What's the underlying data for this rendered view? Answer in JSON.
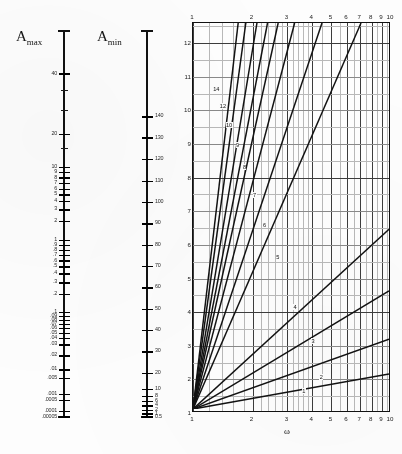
{
  "figure": {
    "type": "nomogram"
  },
  "amax_scale": {
    "title": "A",
    "title_sub": "max",
    "unit": "dB",
    "orientation": "logarithmic-descending",
    "ticks": [
      {
        "label": "40",
        "pos": 0.112
      },
      {
        "label": "",
        "pos": 0.155
      },
      {
        "label": "",
        "pos": 0.205
      },
      {
        "label": "20",
        "pos": 0.268
      },
      {
        "label": "",
        "pos": 0.305
      },
      {
        "label": "10",
        "pos": 0.352
      },
      {
        "label": "9",
        "pos": 0.366
      },
      {
        "label": "8",
        "pos": 0.38
      },
      {
        "label": "7",
        "pos": 0.394
      },
      {
        "label": "6",
        "pos": 0.409
      },
      {
        "label": "5",
        "pos": 0.423
      },
      {
        "label": "4",
        "pos": 0.44
      },
      {
        "label": "3",
        "pos": 0.462
      },
      {
        "label": "2",
        "pos": 0.492
      },
      {
        "label": "1",
        "pos": 0.54
      },
      {
        "label": ".9",
        "pos": 0.553
      },
      {
        "label": ".8",
        "pos": 0.566
      },
      {
        "label": ".7",
        "pos": 0.58
      },
      {
        "label": ".6",
        "pos": 0.594
      },
      {
        "label": ".5",
        "pos": 0.609
      },
      {
        "label": ".4",
        "pos": 0.627
      },
      {
        "label": ".3",
        "pos": 0.65
      },
      {
        "label": ".2",
        "pos": 0.68
      },
      {
        "label": ".1",
        "pos": 0.727
      },
      {
        "label": ".09",
        "pos": 0.737
      },
      {
        "label": ".08",
        "pos": 0.747
      },
      {
        "label": ".07",
        "pos": 0.757
      },
      {
        "label": ".06",
        "pos": 0.768
      },
      {
        "label": ".05",
        "pos": 0.78
      },
      {
        "label": ".04",
        "pos": 0.793
      },
      {
        "label": ".03",
        "pos": 0.81
      },
      {
        "label": ".02",
        "pos": 0.838
      },
      {
        "label": ".01",
        "pos": 0.874
      },
      {
        "label": ".005",
        "pos": 0.896
      },
      {
        "label": ".001",
        "pos": 0.938
      },
      {
        "label": ".0005",
        "pos": 0.953
      },
      {
        "label": ".0001",
        "pos": 0.982
      },
      {
        "label": ".00005",
        "pos": 0.996
      }
    ]
  },
  "amin_scale": {
    "title": "A",
    "title_sub": "min",
    "unit": "dB",
    "orientation": "logarithmic-descending",
    "ticks": [
      {
        "label": "140",
        "pos": 0.222
      },
      {
        "label": "130",
        "pos": 0.277
      },
      {
        "label": "120",
        "pos": 0.332
      },
      {
        "label": "110",
        "pos": 0.388
      },
      {
        "label": "100",
        "pos": 0.443
      },
      {
        "label": "90",
        "pos": 0.498
      },
      {
        "label": "80",
        "pos": 0.553
      },
      {
        "label": "70",
        "pos": 0.608
      },
      {
        "label": "60",
        "pos": 0.663
      },
      {
        "label": "50",
        "pos": 0.718
      },
      {
        "label": "40",
        "pos": 0.773
      },
      {
        "label": "30",
        "pos": 0.828
      },
      {
        "label": "20",
        "pos": 0.883
      },
      {
        "label": "10",
        "pos": 0.925
      },
      {
        "label": "8",
        "pos": 0.942
      },
      {
        "label": "6",
        "pos": 0.955
      },
      {
        "label": "4",
        "pos": 0.967
      },
      {
        "label": "2",
        "pos": 0.979
      },
      {
        "label": "1",
        "pos": 0.988
      },
      {
        "label": "0.5",
        "pos": 0.996
      }
    ]
  },
  "chart_data": {
    "type": "line",
    "title": "",
    "xlabel": "ω",
    "ylabel": "",
    "xscale": "log",
    "yscale": "linear",
    "xlim": [
      1,
      10
    ],
    "ylim": [
      1,
      12.6
    ],
    "grid": true,
    "legend": "inline-curve-labels",
    "x_ticks": [
      "1",
      "2",
      "3",
      "4",
      "5",
      "6",
      "7",
      "8",
      "9",
      "10"
    ],
    "x_tick_values": [
      1,
      2,
      3,
      4,
      5,
      6,
      7,
      8,
      9,
      10
    ],
    "y_ticks": [
      "1",
      "2",
      "3",
      "4",
      "5",
      "6",
      "7",
      "8",
      "9",
      "10",
      "11",
      "12"
    ],
    "y_tick_values": [
      1,
      2,
      3,
      4,
      5,
      6,
      7,
      8,
      9,
      10,
      11,
      12
    ],
    "note": "Each line is the locus of a constant filter order n; all lines radiate from the common point (1,1)",
    "series": [
      {
        "name": "1",
        "order": 1,
        "x_end": 10.0,
        "y_end": 2.05,
        "label_x": 3.55,
        "label_y": 1.62
      },
      {
        "name": "2",
        "order": 2,
        "x_end": 10.0,
        "y_end": 3.1,
        "label_x": 4.35,
        "label_y": 2.05
      },
      {
        "name": "3",
        "order": 3,
        "x_end": 10.0,
        "y_end": 4.55,
        "label_x": 3.95,
        "label_y": 3.1
      },
      {
        "name": "4",
        "order": 4,
        "x_end": 10.0,
        "y_end": 6.4,
        "label_x": 3.2,
        "label_y": 4.12
      },
      {
        "name": "5",
        "order": 5,
        "x_end": 7.2,
        "y_end": 12.6,
        "label_x": 2.62,
        "label_y": 5.6
      },
      {
        "name": "6",
        "order": 6,
        "x_end": 4.55,
        "y_end": 12.6,
        "label_x": 2.25,
        "label_y": 6.55
      },
      {
        "name": "7",
        "order": 7,
        "x_end": 3.3,
        "y_end": 12.6,
        "label_x": 2.0,
        "label_y": 7.45
      },
      {
        "name": "8",
        "order": 8,
        "x_end": 2.72,
        "y_end": 12.6,
        "label_x": 1.78,
        "label_y": 8.3
      },
      {
        "name": "9",
        "order": 9,
        "x_end": 2.4,
        "y_end": 12.6,
        "label_x": 1.64,
        "label_y": 8.95
      },
      {
        "name": "10",
        "order": 10,
        "x_end": 2.12,
        "y_end": 12.6,
        "label_x": 1.46,
        "label_y": 9.55
      },
      {
        "name": "12",
        "order": 12,
        "x_end": 1.86,
        "y_end": 12.6,
        "label_x": 1.36,
        "label_y": 10.1
      },
      {
        "name": "14",
        "order": 14,
        "x_end": 1.7,
        "y_end": 12.6,
        "label_x": 1.26,
        "label_y": 10.6
      }
    ]
  }
}
